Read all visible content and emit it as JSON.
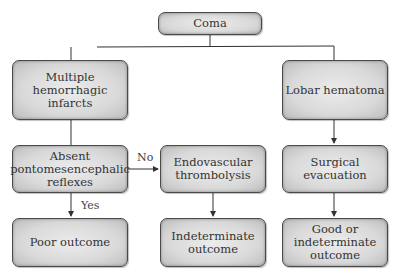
{
  "diagram": {
    "type": "flowchart",
    "nodes": {
      "coma": "Coma",
      "multiple_infarcts": "Multiple\nhemorrhagic\ninfarcts",
      "lobar_hematoma": "Lobar hematoma",
      "absent_reflexes": "Absent\npontomesencephalic\nreflexes",
      "endovascular": "Endovascular\nthrombolysis",
      "surgical": "Surgical\nevacuation",
      "poor_outcome": "Poor outcome",
      "indeterminate_outcome": "Indeterminate\noutcome",
      "good_or_indeterminate": "Good or\nindeterminate\noutcome"
    },
    "edge_labels": {
      "no": "No",
      "yes": "Yes"
    },
    "edges": [
      {
        "from": "Coma",
        "to": "Multiple hemorrhagic infarcts"
      },
      {
        "from": "Coma",
        "to": "Lobar hematoma"
      },
      {
        "from": "Multiple hemorrhagic infarcts",
        "to": "Absent pontomesencephalic reflexes"
      },
      {
        "from": "Absent pontomesencephalic reflexes",
        "to": "Endovascular thrombolysis",
        "label": "No"
      },
      {
        "from": "Absent pontomesencephalic reflexes",
        "to": "Poor outcome",
        "label": "Yes"
      },
      {
        "from": "Endovascular thrombolysis",
        "to": "Indeterminate outcome"
      },
      {
        "from": "Lobar hematoma",
        "to": "Surgical evacuation"
      },
      {
        "from": "Surgical evacuation",
        "to": "Good or indeterminate outcome"
      }
    ],
    "colors": {
      "box_fill": "#d9d9d9",
      "box_border": "#4a4a4a",
      "line": "#333333",
      "text": "#333333"
    }
  }
}
